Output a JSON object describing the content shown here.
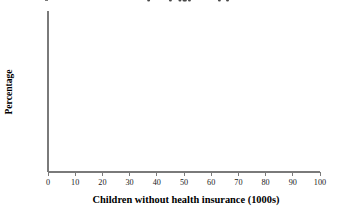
{
  "chart_data": {
    "type": "line",
    "title": "",
    "xlabel": "Children without health insurance (1000s)",
    "ylabel": "Percentage",
    "xlim": [
      0,
      100
    ],
    "ylim": [
      1,
      100
    ],
    "yscale": "probability",
    "grid": false,
    "legend": "none",
    "xticks": [
      0,
      10,
      20,
      30,
      40,
      50,
      60,
      70,
      80,
      90,
      100
    ],
    "xtick_labels": [
      "0",
      "10",
      "20",
      "30",
      "40",
      "50",
      "60",
      "70",
      "80",
      "90",
      "100"
    ],
    "yticks": [
      1,
      5,
      10,
      20,
      30,
      40,
      50,
      60,
      70,
      80,
      90,
      95,
      100
    ],
    "ytick_labels": [
      "1",
      "5",
      "10",
      "20",
      "30",
      "40",
      "50",
      "60",
      "70",
      "80",
      "90",
      "95",
      "100"
    ],
    "series": [
      {
        "name": "lower-confidence-band",
        "type": "curve",
        "x": [
          7.0,
          10.0,
          14.0,
          18.0,
          22.0,
          26.0,
          30.0,
          33.0,
          36.0,
          39.0,
          42.0,
          45.0,
          48.0,
          51.0,
          54.0,
          57.0,
          60.0
        ],
        "y": [
          1.0,
          2.0,
          4.0,
          7.2,
          12.0,
          18.0,
          25.5,
          32.0,
          39.0,
          46.5,
          55.0,
          63.0,
          71.5,
          80.0,
          87.0,
          93.0,
          97.5
        ]
      },
      {
        "name": "fitted-line",
        "type": "curve",
        "x": [
          22.5,
          26.0,
          30.0,
          34.0,
          38.0,
          42.0,
          46.0,
          50.0,
          54.0,
          58.0,
          62.0,
          66.0,
          70.0,
          73.0,
          76.0
        ],
        "y": [
          1.0,
          2.2,
          4.5,
          8.0,
          13.5,
          21.0,
          30.5,
          41.5,
          53.0,
          64.0,
          74.0,
          83.0,
          90.5,
          94.5,
          97.5
        ]
      },
      {
        "name": "upper-confidence-band",
        "type": "curve",
        "x": [
          38.5,
          41.0,
          44.0,
          47.0,
          50.0,
          54.0,
          58.0,
          62.0,
          66.0,
          70.0,
          75.0,
          80.0,
          85.0,
          88.0,
          91.0
        ],
        "y": [
          1.0,
          2.0,
          4.0,
          7.0,
          11.0,
          18.0,
          26.5,
          36.5,
          47.0,
          57.5,
          71.0,
          81.5,
          90.0,
          94.0,
          97.5
        ]
      }
    ],
    "points": {
      "name": "observed-data-points",
      "x": [
        37.0,
        45.0,
        48.5,
        50.0,
        50.5,
        52.0,
        63.0,
        66.0
      ],
      "y": [
        27.5,
        37.0,
        45.0,
        51.0,
        52.5,
        60.0,
        69.5,
        83.5
      ]
    }
  }
}
